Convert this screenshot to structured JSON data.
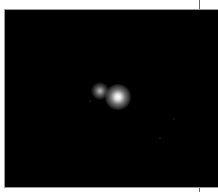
{
  "image": {
    "description": "Dark field image with two bright point sources",
    "background_color": "#000000",
    "frame_border_color": "#9a9a9a",
    "sources": [
      {
        "name": "dim-source",
        "x": 95,
        "y": 81,
        "brightness": "medium"
      },
      {
        "name": "bright-source",
        "x": 113,
        "y": 87,
        "brightness": "high"
      }
    ]
  }
}
